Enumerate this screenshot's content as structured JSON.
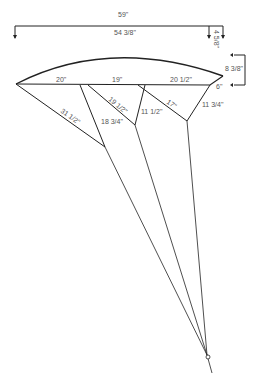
{
  "diagram": {
    "type": "kite-bridle-dimension-drawing",
    "colors": {
      "line": "#222222",
      "text": "#555555",
      "background": "#ffffff"
    },
    "dimensions": {
      "overall_span": "59\"",
      "chord_span": "54 3/8\"",
      "tip_offset": "4 5/8\"",
      "arc_height": "8 3/8\"",
      "tip_drop": "6\""
    },
    "chord_segments": [
      "20\"",
      "19\"",
      "20 1/2\""
    ],
    "bridle_lines": {
      "left_outer": "31 1/2\"",
      "inner_a": "19 1/2\"",
      "inner_b": "18 3/4\"",
      "center": "11 1/2\"",
      "right_a": "17\"",
      "right_b": "11 3/4\""
    },
    "tow_point": "tow-ring"
  }
}
